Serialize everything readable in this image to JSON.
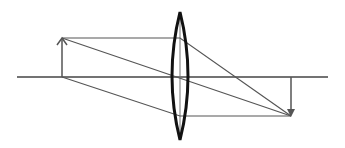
{
  "diagram": {
    "type": "convex-lens-ray-diagram",
    "colors": {
      "background": "#ffffff",
      "axis": "#444444",
      "rays": "#555555",
      "lens": "#111111",
      "arrows": "#555555"
    },
    "optical_axis": {
      "x1": 17,
      "x2": 328,
      "y": 77
    },
    "lens": {
      "cx": 180,
      "top": 12,
      "bottom": 140,
      "half_width": 8
    },
    "lens_center_line": {
      "x": 180,
      "y1": 12,
      "y2": 140
    },
    "object_arrow": {
      "x": 62,
      "base_y": 77,
      "tip_y": 38,
      "direction": "up"
    },
    "image_arrow": {
      "x": 291,
      "base_y": 77,
      "tip_y": 116,
      "direction": "down"
    },
    "rays": [
      {
        "name": "parallel-ray",
        "points": [
          [
            62,
            38
          ],
          [
            180,
            38
          ],
          [
            291,
            116
          ]
        ]
      },
      {
        "name": "central-ray",
        "points": [
          [
            62,
            38
          ],
          [
            291,
            116
          ]
        ]
      },
      {
        "name": "base-ray",
        "points": [
          [
            62,
            77
          ],
          [
            180,
            116
          ],
          [
            291,
            116
          ]
        ]
      }
    ]
  }
}
